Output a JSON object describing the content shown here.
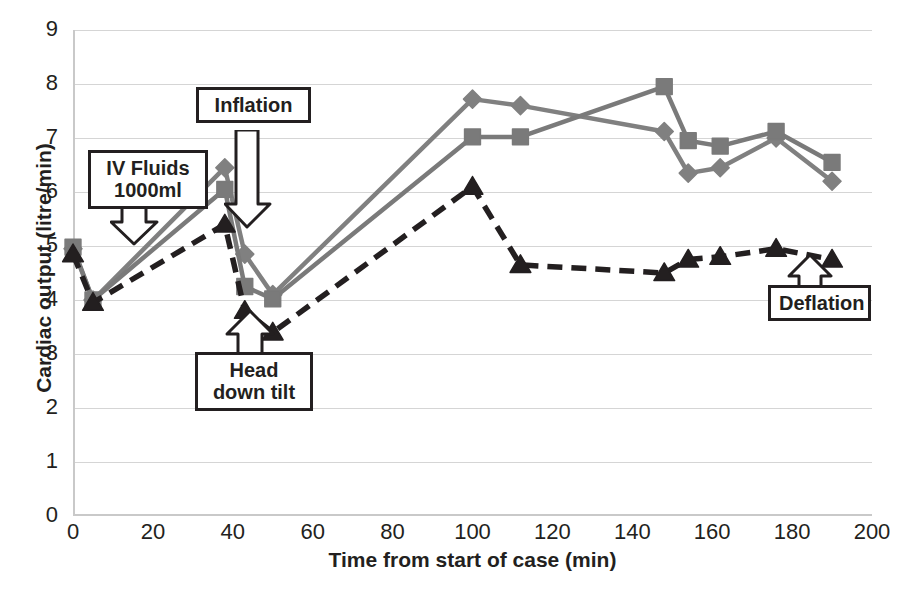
{
  "chart_data": {
    "type": "line",
    "title": "",
    "xlabel": "Time from start of case (min)",
    "ylabel": "Cardiac output (litre/min)",
    "xlim": [
      0,
      200
    ],
    "ylim": [
      0,
      9
    ],
    "xticks": [
      0,
      20,
      40,
      60,
      80,
      100,
      120,
      140,
      160,
      180,
      200
    ],
    "yticks": [
      0,
      1,
      2,
      3,
      4,
      5,
      6,
      7,
      8,
      9
    ],
    "grid": "horizontal",
    "legend": "none",
    "series": [
      {
        "name": "series-diamond",
        "marker": "diamond",
        "linestyle": "solid",
        "color": "#808080",
        "points": [
          {
            "x": 0,
            "y": 4.95
          },
          {
            "x": 5,
            "y": 4.0
          },
          {
            "x": 38,
            "y": 6.45
          },
          {
            "x": 43,
            "y": 4.85
          },
          {
            "x": 50,
            "y": 4.1
          },
          {
            "x": 100,
            "y": 7.72
          },
          {
            "x": 112,
            "y": 7.6
          },
          {
            "x": 148,
            "y": 7.12
          },
          {
            "x": 154,
            "y": 6.35
          },
          {
            "x": 162,
            "y": 6.45
          },
          {
            "x": 176,
            "y": 7.0
          },
          {
            "x": 190,
            "y": 6.2
          }
        ]
      },
      {
        "name": "series-square",
        "marker": "square",
        "linestyle": "solid",
        "color": "#7a7a7a",
        "points": [
          {
            "x": 0,
            "y": 4.98
          },
          {
            "x": 5,
            "y": 4.0
          },
          {
            "x": 38,
            "y": 6.05
          },
          {
            "x": 43,
            "y": 4.25
          },
          {
            "x": 50,
            "y": 4.02
          },
          {
            "x": 100,
            "y": 7.02
          },
          {
            "x": 112,
            "y": 7.02
          },
          {
            "x": 148,
            "y": 7.95
          },
          {
            "x": 154,
            "y": 6.95
          },
          {
            "x": 162,
            "y": 6.85
          },
          {
            "x": 176,
            "y": 7.12
          },
          {
            "x": 190,
            "y": 6.55
          }
        ]
      },
      {
        "name": "series-triangle",
        "marker": "triangle",
        "linestyle": "dashed",
        "color": "#231f20",
        "points": [
          {
            "x": 0,
            "y": 4.85
          },
          {
            "x": 5,
            "y": 3.95
          },
          {
            "x": 38,
            "y": 5.4
          },
          {
            "x": 43,
            "y": 3.8
          },
          {
            "x": 50,
            "y": 3.4
          },
          {
            "x": 100,
            "y": 6.1
          },
          {
            "x": 112,
            "y": 4.65
          },
          {
            "x": 148,
            "y": 4.5
          },
          {
            "x": 154,
            "y": 4.75
          },
          {
            "x": 162,
            "y": 4.8
          },
          {
            "x": 176,
            "y": 4.95
          },
          {
            "x": 190,
            "y": 4.75
          }
        ]
      }
    ],
    "annotations": [
      {
        "name": "iv-fluids",
        "text": "IV Fluids 1000ml",
        "line1": "IV Fluids",
        "line2": "1000ml",
        "points_to_x": 18,
        "points_to_y": 4.55
      },
      {
        "name": "inflation",
        "text": "Inflation",
        "line1": "Inflation",
        "line2": "",
        "points_to_x": 43,
        "points_to_y": 5.2
      },
      {
        "name": "head-down-tilt",
        "text": "Head down tilt",
        "line1": "Head",
        "line2": "down tilt",
        "points_to_x": 44,
        "points_to_y": 3.6
      },
      {
        "name": "deflation",
        "text": "Deflation",
        "line1": "Deflation",
        "line2": "",
        "points_to_x": 176,
        "points_to_y": 4.6
      }
    ]
  },
  "axis": {
    "y_title": "Cardiac output (litre/min)",
    "x_title": "Time from start of case (min)",
    "y_tick_labels": [
      "9",
      "8",
      "7",
      "6",
      "5",
      "4",
      "3",
      "2",
      "1",
      "0"
    ],
    "x_tick_labels": [
      "0",
      "20",
      "40",
      "60",
      "80",
      "100",
      "120",
      "140",
      "160",
      "180",
      "200"
    ]
  },
  "callouts": {
    "iv_fluids_line1": "IV Fluids",
    "iv_fluids_line2": "1000ml",
    "inflation": "Inflation",
    "head_down_line1": "Head",
    "head_down_line2": "down tilt",
    "deflation": "Deflation"
  },
  "colors": {
    "diamond_series": "#808080",
    "square_series": "#7a7a7a",
    "triangle_series": "#231f20",
    "gridline": "#d5d5d5",
    "axis": "#c9c9c9",
    "text": "#231f20"
  }
}
